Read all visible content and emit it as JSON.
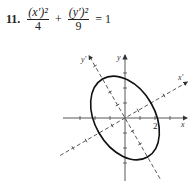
{
  "problem": {
    "number": "11.",
    "term1_num": "(x′)²",
    "term1_den": "4",
    "plus": "+",
    "term2_num": "(y′)²",
    "term2_den": "9",
    "equals": "= 1"
  },
  "figure": {
    "x_label": "x",
    "y_label": "y",
    "xprime_label": "x′",
    "yprime_label": "y′",
    "tick_label": "2",
    "rotation_deg": 30,
    "semi_axis_xprime": 2,
    "semi_axis_yprime": 3
  }
}
